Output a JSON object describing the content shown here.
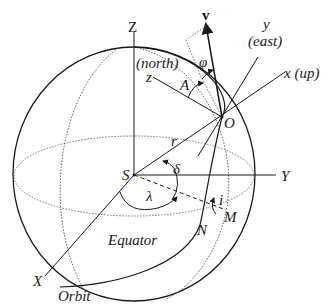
{
  "diagram": {
    "labels": {
      "Z": "Z",
      "Y": "Y",
      "X": "X",
      "S": "S",
      "O": "O",
      "M": "M",
      "N": "N",
      "v": "v",
      "y": "y",
      "east": "(east)",
      "x_up": "x (up)",
      "north": "(north)",
      "z": "z",
      "A": "A",
      "phi": "φ",
      "r": "r",
      "delta": "δ",
      "lambda": "λ",
      "i": "i",
      "equator": "Equator",
      "orbit": "Orbit"
    },
    "colors": {
      "line": "#1a1a1a",
      "dotted": "#555555",
      "background": "#ffffff"
    }
  }
}
